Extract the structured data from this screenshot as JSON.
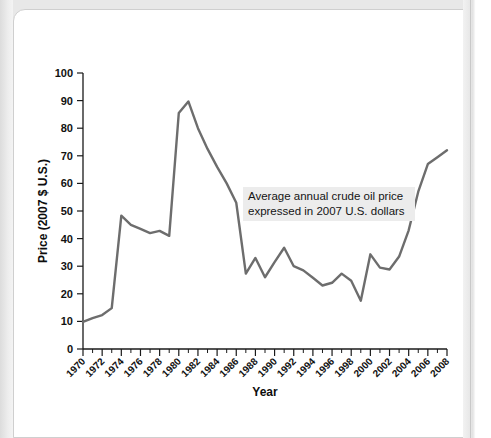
{
  "figure": {
    "name": "crude-oil-price-line-chart"
  },
  "annotation": {
    "line1": "Average annual crude oil price",
    "line2": "expressed in 2007 U.S. dollars",
    "background": "#ececec"
  },
  "style": {
    "line_color": "#6d6d6d",
    "axis_color": "#1a1a1a",
    "page_background": "#e8e8e8",
    "card_background": "#ffffff"
  },
  "chart_data": {
    "type": "line",
    "title": "",
    "xlabel": "Year",
    "ylabel": "Price (2007 $ U.S.)",
    "xlim": [
      1970,
      2008
    ],
    "ylim": [
      0,
      100
    ],
    "grid": false,
    "legend": "none",
    "x_major_tick_step": 2,
    "x_minor_tick_step": 1,
    "y_tick_step": 10,
    "xticks": [
      1970,
      1972,
      1974,
      1976,
      1978,
      1980,
      1982,
      1984,
      1986,
      1988,
      1990,
      1992,
      1994,
      1996,
      1998,
      2000,
      2002,
      2004,
      2006,
      2008
    ],
    "yticks": [
      0,
      10,
      20,
      30,
      40,
      50,
      60,
      70,
      80,
      90,
      100
    ],
    "series": [
      {
        "name": "Average annual crude oil price (2007 $ U.S.)",
        "x": [
          1970,
          1971,
          1972,
          1973,
          1974,
          1975,
          1976,
          1977,
          1978,
          1979,
          1980,
          1981,
          1982,
          1983,
          1984,
          1985,
          1986,
          1987,
          1988,
          1989,
          1990,
          1991,
          1992,
          1993,
          1994,
          1995,
          1996,
          1997,
          1998,
          1999,
          2000,
          2001,
          2002,
          2003,
          2004,
          2005,
          2006,
          2007,
          2008
        ],
        "values": [
          9.8,
          11.2,
          12.3,
          14.8,
          48.3,
          45.0,
          43.5,
          42.0,
          42.8,
          41.0,
          85.5,
          89.7,
          80.0,
          72.5,
          66.0,
          60.0,
          53.0,
          27.3,
          33.0,
          26.0,
          31.5,
          36.7,
          30.0,
          28.5,
          25.8,
          23.0,
          24.0,
          27.3,
          24.7,
          17.5,
          34.3,
          29.5,
          28.8,
          33.5,
          43.0,
          57.0,
          67.0,
          69.5,
          72.0
        ]
      }
    ]
  },
  "plot_geometry": {
    "left": 83,
    "right": 447,
    "top": 73,
    "bottom": 349
  }
}
